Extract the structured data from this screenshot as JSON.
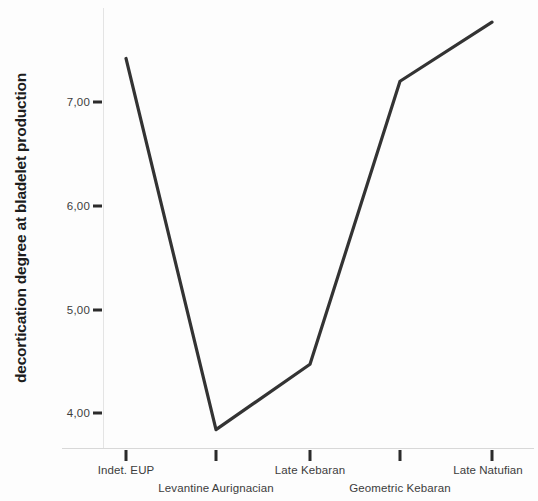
{
  "chart_data": {
    "type": "line",
    "title": "",
    "subtitle": "",
    "xlabel": "",
    "ylabel": "decortication degree at bladelet production",
    "categories": [
      "Indet. EUP",
      "Levantine Aurignacian",
      "Late Kebaran",
      "Geometric Kebaran",
      "Late Natufian"
    ],
    "values": [
      7.42,
      3.84,
      4.47,
      7.2,
      7.77
    ],
    "series": [
      {
        "name": "decortication degree at bladelet production",
        "values": [
          7.42,
          3.84,
          4.47,
          7.2,
          7.77
        ]
      }
    ],
    "ytick_labels": [
      "7,00",
      "6,00",
      "5,00",
      "4,00"
    ],
    "ytick_values": [
      7.0,
      6.0,
      5.0,
      4.0
    ],
    "ylim": [
      3.6,
      7.95
    ],
    "grid": false,
    "legend": false,
    "legend_position": "none",
    "line_color": "#333333",
    "markers": false,
    "decimal_separator": ","
  },
  "axes": {
    "y_title": "decortication degree at bladelet production",
    "y_ticks": [
      {
        "label": "7,00",
        "value": 7.0
      },
      {
        "label": "6,00",
        "value": 6.0
      },
      {
        "label": "5,00",
        "value": 5.0
      },
      {
        "label": "4,00",
        "value": 4.0
      }
    ],
    "x_ticks": [
      {
        "label": "Indet. EUP",
        "row": "top"
      },
      {
        "label": "Levantine Aurignacian",
        "row": "bottom"
      },
      {
        "label": "Late Kebaran",
        "row": "top"
      },
      {
        "label": "Geometric Kebaran",
        "row": "bottom"
      },
      {
        "label": "Late Natufian",
        "row": "top"
      }
    ]
  },
  "colors": {
    "line": "#333333",
    "tick": "#2b2b2b",
    "text": "#3c3c3c",
    "title": "#1d1d1d",
    "background": "#fdfdfd",
    "axis": "#dcdcdc"
  }
}
